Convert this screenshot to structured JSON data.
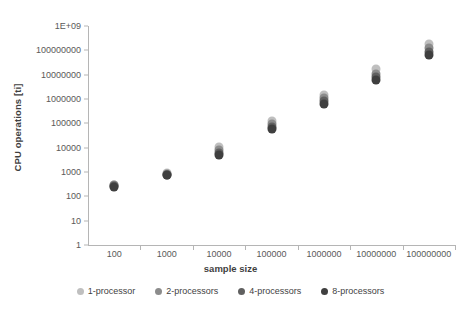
{
  "chart_data": {
    "type": "scatter",
    "title": "",
    "xlabel": "sample size",
    "ylabel": "CPU operations [ti]",
    "xscale": "log",
    "yscale": "log",
    "grid": false,
    "legend_position": "bottom",
    "x_tick_labels": [
      "100",
      "1000",
      "10000",
      "100000",
      "1000000",
      "10000000",
      "100000000"
    ],
    "x": [
      100,
      1000,
      10000,
      100000,
      1000000,
      10000000,
      100000000
    ],
    "y_tick_labels": [
      "1",
      "10",
      "100",
      "1000",
      "10000",
      "100000",
      "1000000",
      "10000000",
      "100000000",
      "1E+09"
    ],
    "ylim": [
      1,
      1000000000
    ],
    "series": [
      {
        "name": "1-processor",
        "color": "#bfbfbf",
        "values": [
          300,
          900,
          11000,
          130000,
          1500000,
          17000000,
          190000000
        ]
      },
      {
        "name": "2-processors",
        "color": "#8c8c8c",
        "values": [
          280,
          830,
          8000,
          95000,
          1050000,
          11000000,
          120000000
        ]
      },
      {
        "name": "4-processors",
        "color": "#606060",
        "values": [
          260,
          780,
          6200,
          72000,
          800000,
          8000000,
          85000000
        ]
      },
      {
        "name": "8-processors",
        "color": "#3f3f3f",
        "values": [
          240,
          720,
          5200,
          60000,
          650000,
          6200000,
          66000000
        ]
      }
    ]
  },
  "legend": {
    "items": [
      {
        "label": "1-processor"
      },
      {
        "label": "2-processors"
      },
      {
        "label": "4-processors"
      },
      {
        "label": "8-processors"
      }
    ]
  }
}
